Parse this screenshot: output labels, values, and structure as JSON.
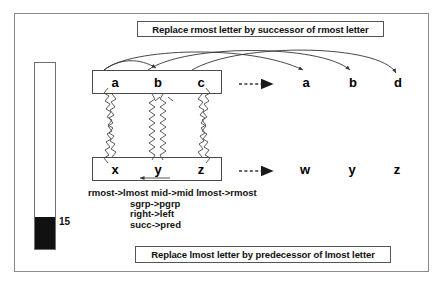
{
  "figure": {
    "caption_top": "Replace rmost letter by successor of rmost letter",
    "caption_bottom": "Replace lmost letter by predecessor of lmost letter"
  },
  "gauge": {
    "value_label": "15",
    "fill_percent": 17
  },
  "source_top": {
    "letters": [
      "a",
      "b",
      "c"
    ]
  },
  "source_bottom": {
    "letters": [
      "x",
      "y",
      "z"
    ]
  },
  "result_top": {
    "letters": [
      "a",
      "b",
      "d"
    ]
  },
  "result_bottom": {
    "letters": [
      "w",
      "y",
      "z"
    ]
  },
  "mappings": {
    "line1": "rmost->lmost  mid->mid  lmost->rmost",
    "line2": "sgrp->pgrp",
    "line3": "right->left",
    "line4": "succ->pred"
  },
  "colors": {
    "ink": "#000000",
    "frame": "#8a8a8a",
    "fill": "#111111",
    "paper": "#ffffff"
  }
}
